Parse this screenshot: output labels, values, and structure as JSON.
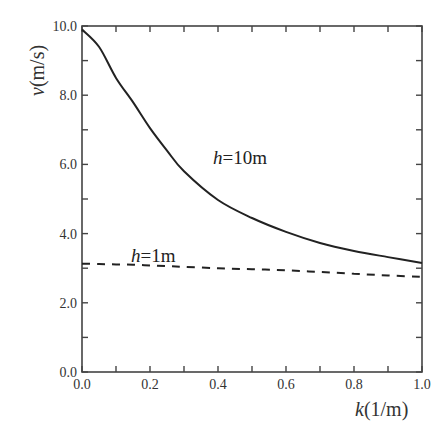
{
  "chart_data": {
    "type": "line",
    "title": "",
    "xlabel": "k(1/m)",
    "xlabel_italic": "k",
    "xlabel_unit": "(1/m)",
    "ylabel": "v(m/s)",
    "ylabel_italic": "v",
    "ylabel_unit": "(m/s)",
    "xlim": [
      0.0,
      1.0
    ],
    "ylim": [
      0.0,
      10.0
    ],
    "x_ticks": [
      "0.0",
      "0.2",
      "0.4",
      "0.6",
      "0.8",
      "1.0"
    ],
    "y_ticks": [
      "0.0",
      "2.0",
      "4.0",
      "6.0",
      "8.0",
      "10.0"
    ],
    "x_minor_step": 0.1,
    "y_minor_step": 1.0,
    "grid": false,
    "legend": "inline labels",
    "x": [
      0.0,
      0.05,
      0.1,
      0.15,
      0.2,
      0.25,
      0.3,
      0.4,
      0.5,
      0.6,
      0.7,
      0.8,
      0.9,
      1.0
    ],
    "series": [
      {
        "name": "h=10m",
        "label_italic": "h",
        "label_rest": "=10m",
        "style": "solid",
        "values": [
          9.9,
          9.4,
          8.5,
          7.8,
          7.05,
          6.4,
          5.8,
          4.97,
          4.45,
          4.05,
          3.73,
          3.5,
          3.32,
          3.15
        ]
      },
      {
        "name": "h=1m",
        "label_italic": "h",
        "label_rest": "=1m",
        "style": "dashed",
        "values": [
          3.13,
          3.12,
          3.11,
          3.1,
          3.08,
          3.06,
          3.04,
          3.0,
          2.97,
          2.94,
          2.89,
          2.84,
          2.79,
          2.75
        ]
      }
    ],
    "colors": {
      "line": "#222222",
      "axis": "#444444",
      "text": "#333333",
      "background": "#ffffff"
    }
  }
}
